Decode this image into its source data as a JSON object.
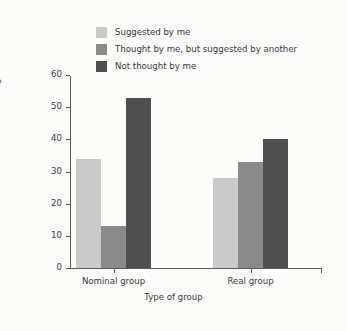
{
  "chart_data": {
    "type": "bar",
    "title": "",
    "subtitle": "",
    "xlabel": "Type of group",
    "ylabel": "Percentage of ideas",
    "categories": [
      "Nominal group",
      "Real group"
    ],
    "series": [
      {
        "name": "Suggested by me",
        "values": [
          34,
          28
        ],
        "color": "#c9c9c9"
      },
      {
        "name": "Thought by me, but suggested by another",
        "values": [
          13,
          33
        ],
        "color": "#8a8a8a"
      },
      {
        "name": "Not thought by me",
        "values": [
          53,
          40
        ],
        "color": "#4f4f4f"
      }
    ],
    "ylim": [
      0,
      60
    ],
    "yticks": [
      0,
      10,
      20,
      30,
      40,
      50,
      60
    ],
    "ytick_labels": [
      "0",
      "10",
      "20",
      "30",
      "40",
      "50",
      "60"
    ],
    "grid": false,
    "legend_position": "top-left",
    "background_color": "#fbfbfa",
    "axis_color": "#5d5d5d",
    "text_color": "#3a3a3a"
  }
}
